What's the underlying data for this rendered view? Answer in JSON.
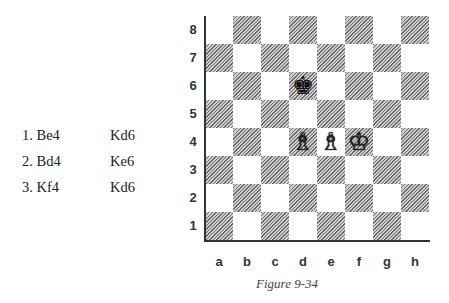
{
  "moves": [
    {
      "white": "1. Be4",
      "black": "Kd6"
    },
    {
      "white": "2. Bd4",
      "black": "Ke6"
    },
    {
      "white": "3. Kf4",
      "black": "Kd6"
    }
  ],
  "board": {
    "ranks": [
      "8",
      "7",
      "6",
      "5",
      "4",
      "3",
      "2",
      "1"
    ],
    "files": [
      "a",
      "b",
      "c",
      "d",
      "e",
      "f",
      "g",
      "h"
    ],
    "pieces": {
      "d6": {
        "piece": "king",
        "color": "black",
        "glyph": "♚"
      },
      "d4": {
        "piece": "bishop",
        "color": "white",
        "glyph": "♗"
      },
      "e4": {
        "piece": "bishop",
        "color": "white",
        "glyph": "♗"
      },
      "f4": {
        "piece": "king",
        "color": "white",
        "glyph": "♔"
      }
    }
  },
  "caption": "Figure 9-34"
}
